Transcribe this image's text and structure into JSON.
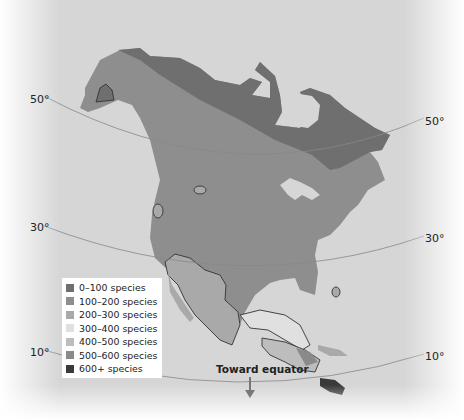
{
  "map": {
    "title": "",
    "latitude_labels": {
      "left": [
        {
          "label": "50°",
          "x": 30,
          "y": 93
        },
        {
          "label": "30°",
          "x": 30,
          "y": 221
        },
        {
          "label": "10°",
          "x": 30,
          "y": 346
        }
      ],
      "right": [
        {
          "label": "50°",
          "x": 425,
          "y": 115
        },
        {
          "label": "30°",
          "x": 425,
          "y": 232
        },
        {
          "label": "10°",
          "x": 425,
          "y": 350
        }
      ]
    },
    "equator_label": "Toward equator",
    "colors": {
      "ocean": "#d8d8d8",
      "border_line": "#333333",
      "latitude_line": "#888888"
    }
  },
  "legend": {
    "items": [
      {
        "label": "0–100 species",
        "color": "#6f6f6f"
      },
      {
        "label": "100–200 species",
        "color": "#8e8e8e"
      },
      {
        "label": "200–300 species",
        "color": "#a9a9a9"
      },
      {
        "label": "300–400 species",
        "color": "#e0e0e0"
      },
      {
        "label": "400–500 species",
        "color": "#bdbdbd"
      },
      {
        "label": "500–600 species",
        "color": "#8a8a8a"
      },
      {
        "label": "600+ species",
        "color": "#3a3a3a"
      }
    ]
  }
}
